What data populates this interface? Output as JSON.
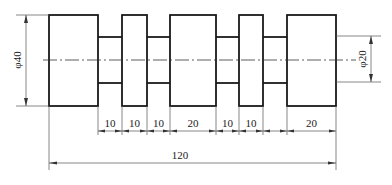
{
  "drawing": {
    "type": "stepped-shaft-technical-drawing",
    "diameters": {
      "large": {
        "label": "φ40",
        "value": 40
      },
      "small": {
        "label": "φ20",
        "value": 20
      }
    },
    "segment_lengths": [
      {
        "label": "10",
        "value": 10
      },
      {
        "label": "10",
        "value": 10
      },
      {
        "label": "10",
        "value": 10
      },
      {
        "label": "20",
        "value": 20
      },
      {
        "label": "10",
        "value": 10
      },
      {
        "label": "10",
        "value": 10
      },
      {
        "label": "20",
        "value": 20
      }
    ],
    "total_length": {
      "label": "120",
      "value": 120
    }
  }
}
